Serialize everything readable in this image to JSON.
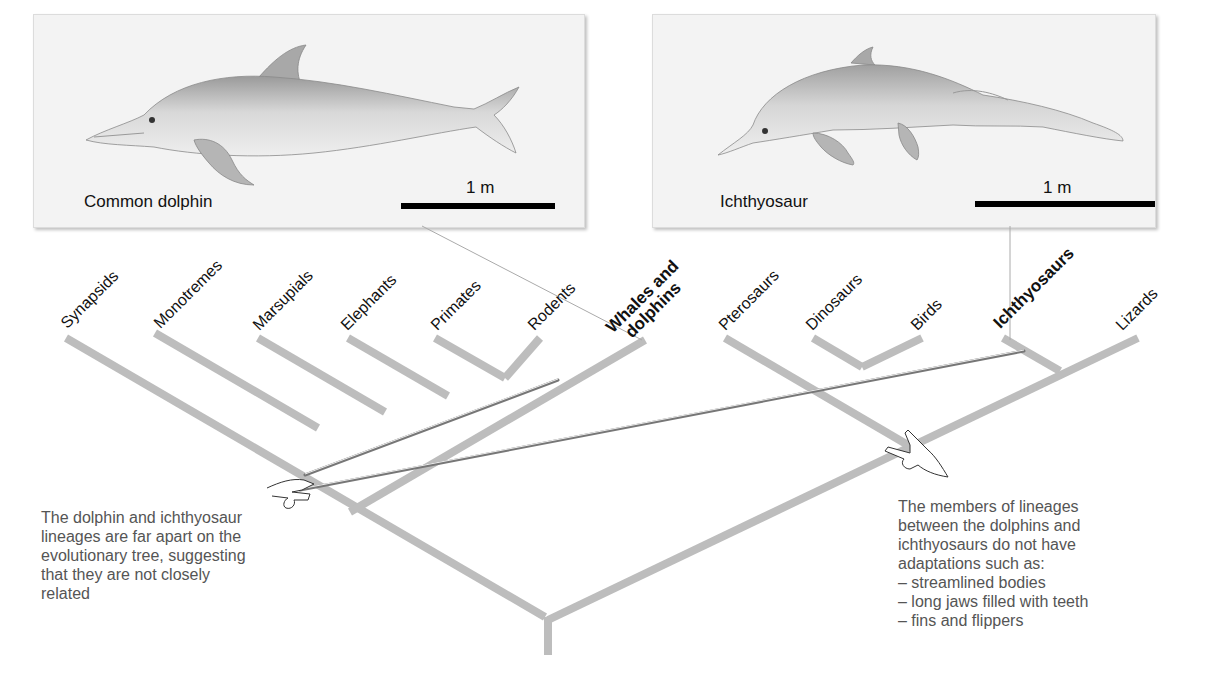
{
  "panels": {
    "left": {
      "animal": "Common dolphin",
      "icon": "dolphin-illustration",
      "scale_label": "1 m"
    },
    "right": {
      "animal": "Ichthyosaur",
      "icon": "ichthyosaur-illustration",
      "scale_label": "1 m"
    }
  },
  "tree": {
    "branch_color": "#bdbdbd",
    "taxa": [
      {
        "label": "Synapsids",
        "bold": false
      },
      {
        "label": "Monotremes",
        "bold": false
      },
      {
        "label": "Marsupials",
        "bold": false
      },
      {
        "label": "Elephants",
        "bold": false
      },
      {
        "label": "Primates",
        "bold": false
      },
      {
        "label": "Rodents",
        "bold": false
      },
      {
        "label_line1": "Whales and",
        "label_line2": "dolphins",
        "bold": true
      },
      {
        "label": "Pterosaurs",
        "bold": false
      },
      {
        "label": "Dinosaurs",
        "bold": false
      },
      {
        "label": "Birds",
        "bold": false
      },
      {
        "label": "Ichthyosaurs",
        "bold": true
      },
      {
        "label": "Lizards",
        "bold": false
      }
    ]
  },
  "captions": {
    "left": [
      "The dolphin and ichthyosaur",
      "lineages are far apart on the",
      "evolutionary tree, suggesting",
      "that they are not closely",
      "related"
    ],
    "right": [
      "The members of lineages",
      "between the dolphins and",
      "ichthyosaurs do not have",
      "adaptations such as:",
      "– streamlined bodies",
      "– long jaws filled with teeth",
      "– fins and flippers"
    ]
  },
  "icons": {
    "left_hand": "hand-holding-pointers-icon",
    "right_hand": "hand-pointing-icon"
  }
}
